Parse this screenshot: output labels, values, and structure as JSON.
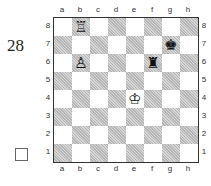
{
  "puzzle": {
    "number": "28",
    "checkbox_checked": false
  },
  "board": {
    "files": [
      "a",
      "b",
      "c",
      "d",
      "e",
      "f",
      "g",
      "h"
    ],
    "ranks": [
      "8",
      "7",
      "6",
      "5",
      "4",
      "3",
      "2",
      "1"
    ],
    "colors": {
      "dark": "#c8c8c8",
      "light": "#ffffff",
      "border": "#333333"
    },
    "pieces": [
      {
        "square": "b8",
        "color": "white",
        "type": "rook",
        "glyph": "♖"
      },
      {
        "square": "b6",
        "color": "white",
        "type": "pawn",
        "glyph": "♙"
      },
      {
        "square": "e4",
        "color": "white",
        "type": "king",
        "glyph": "♔"
      },
      {
        "square": "g7",
        "color": "black",
        "type": "king",
        "glyph": "♚"
      },
      {
        "square": "f6",
        "color": "black",
        "type": "rook",
        "glyph": "♜"
      }
    ]
  }
}
